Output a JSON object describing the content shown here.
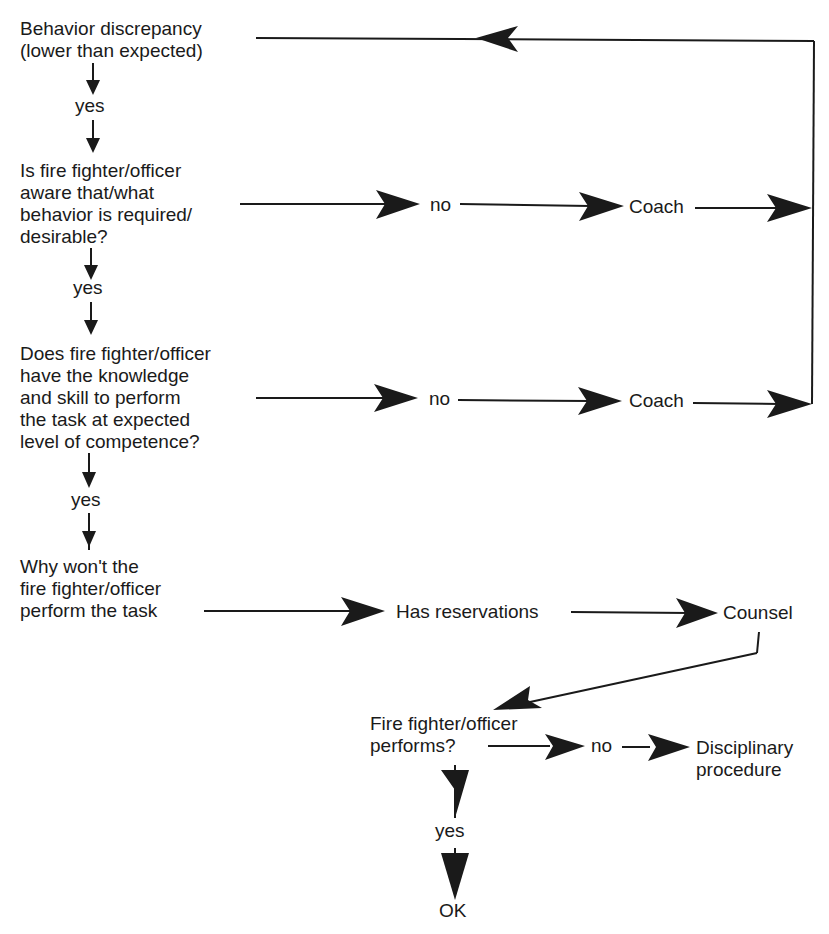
{
  "diagram": {
    "type": "flowchart",
    "nodes": {
      "start": "Behavior discrepancy\n(lower than expected)",
      "q1": "Is fire fighter/officer\naware that/what\nbehavior is required/\ndesirable?",
      "q2": "Does fire fighter/officer\nhave the knowledge\nand skill to perform\nthe task at expected\nlevel of competence?",
      "q3": "Why won't the\nfire fighter/officer\nperform the task",
      "reservations": "Has reservations",
      "counsel": "Counsel",
      "q4": "Fire fighter/officer\nperforms?",
      "coach1": "Coach",
      "coach2": "Coach",
      "discipline": "Disciplinary\nprocedure",
      "ok": "OK"
    },
    "edge_labels": {
      "yes1": "yes",
      "yes2": "yes",
      "yes3": "yes",
      "yes4": "yes",
      "no1": "no",
      "no2": "no",
      "no3": "no"
    },
    "edges": [
      {
        "from": "start",
        "to": "q1",
        "label": "yes"
      },
      {
        "from": "q1",
        "to": "coach1",
        "label": "no"
      },
      {
        "from": "q1",
        "to": "q2",
        "label": "yes"
      },
      {
        "from": "q2",
        "to": "coach2",
        "label": "no"
      },
      {
        "from": "q2",
        "to": "q3",
        "label": "yes"
      },
      {
        "from": "coach1",
        "to": "start",
        "label": ""
      },
      {
        "from": "coach2",
        "to": "start",
        "label": ""
      },
      {
        "from": "q3",
        "to": "reservations",
        "label": ""
      },
      {
        "from": "reservations",
        "to": "counsel",
        "label": ""
      },
      {
        "from": "counsel",
        "to": "q4",
        "label": ""
      },
      {
        "from": "q4",
        "to": "discipline",
        "label": "no"
      },
      {
        "from": "q4",
        "to": "ok",
        "label": "yes"
      }
    ],
    "colors": {
      "ink": "#1a1a1a",
      "background": "#ffffff"
    }
  }
}
